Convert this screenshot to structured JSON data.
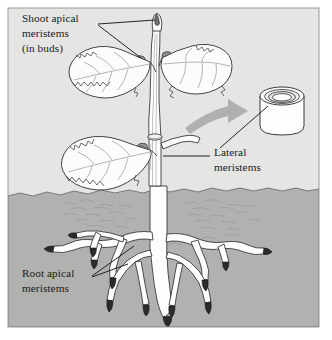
{
  "figure": {
    "panel": {
      "background_color": "#e5e5e3",
      "soil_color": "#b1b1af",
      "border_color": "#9a9a98",
      "x": 8,
      "y": 8,
      "width": 311,
      "height": 319
    }
  },
  "labels": [
    {
      "id": "shoot-apical",
      "lines": [
        "Shoot apical",
        "meristems",
        "(in buds)"
      ],
      "x": 22,
      "y": 22,
      "anchor": "start"
    },
    {
      "id": "lateral",
      "lines": [
        "Lateral",
        "meristems"
      ],
      "x": 214,
      "y": 156,
      "anchor": "start"
    },
    {
      "id": "root-apical",
      "lines": [
        "Root apical",
        "meristems"
      ],
      "x": 22,
      "y": 277,
      "anchor": "start"
    }
  ],
  "plant": {
    "stem_color": "#fdfdfd",
    "leaf_color": "#fcfcfc",
    "outline_color": "#3a3a3a",
    "bud_shade_color": "#6e6e6e",
    "root_color": "#fdfdfd",
    "root_tip_color": "#2b2b2b",
    "vein_color": "#8d8d8d"
  },
  "callout": {
    "arrow_color": "#a8a8a6",
    "cylinder_face_color": "#fdfdfd",
    "cylinder_outline_color": "#3a3a3a",
    "ring_inner_color": "#efefee"
  },
  "parts": {
    "apical_bud": "apical-bud",
    "axillary_bud": "axillary-bud",
    "stem": "stem",
    "leaf": "leaf",
    "soil": "soil-layer",
    "ground_line": "ground-line",
    "taproot": "taproot",
    "lateral_root": "lateral-root",
    "root_tip": "root-tip",
    "cambium_cylinder": "cambium-cylinder",
    "callout_arrow": "callout-arrow",
    "leader_line": "leader-line"
  }
}
